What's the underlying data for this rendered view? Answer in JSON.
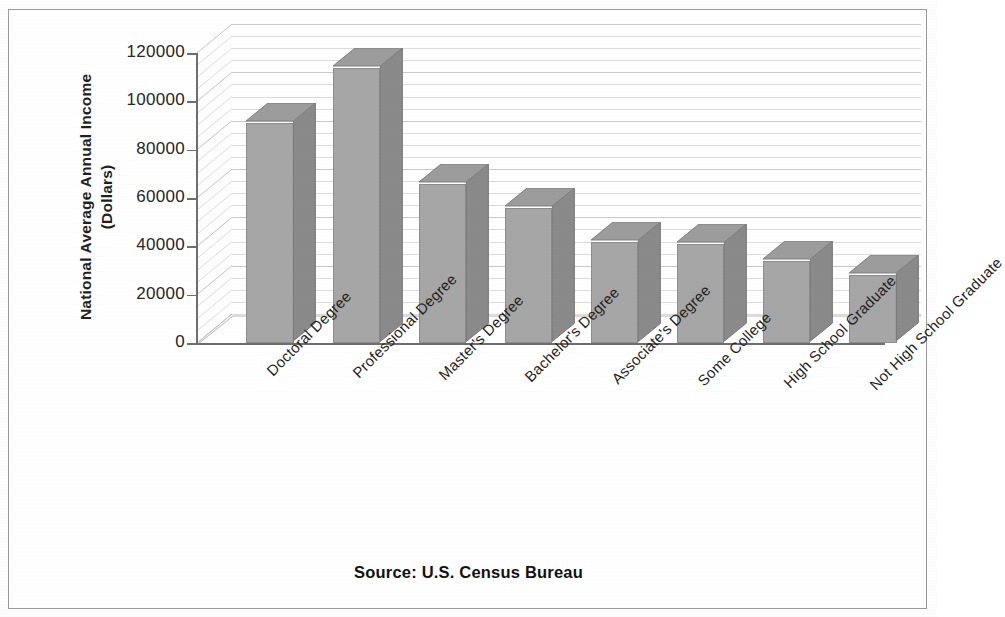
{
  "source_caption": "Source: U.S. Census Bureau",
  "axis": {
    "y_title_line1": "National Average Annual Income",
    "y_title_line2": "(Dollars)"
  },
  "chart_data": {
    "type": "bar",
    "title": "",
    "subtitle": "",
    "xlabel": "",
    "ylabel": "National Average Annual Income (Dollars)",
    "ylim": [
      0,
      120000
    ],
    "ytick_labels": [
      "0",
      "20000",
      "40000",
      "60000",
      "80000",
      "100000",
      "120000"
    ],
    "ytick_values": [
      0,
      20000,
      40000,
      60000,
      80000,
      100000,
      120000
    ],
    "grid": true,
    "grid_orientation": "horizontal",
    "legend": false,
    "three_d": true,
    "bar_color": "#a6a6a6",
    "bar_side_color": "#8a8a8a",
    "bar_top_color": "#9c9c9c",
    "categories": [
      "Doctoral Degree",
      "Professional Degree",
      "Master's Degree",
      "Bachelor's Degree",
      "Associate's Degree",
      "Some College",
      "High School Graduate",
      "Not High School Graduate"
    ],
    "values": [
      91000,
      114000,
      66000,
      56000,
      42000,
      41000,
      34000,
      28000
    ],
    "series": [
      {
        "name": "National Average Annual Income",
        "values": [
          91000,
          114000,
          66000,
          56000,
          42000,
          41000,
          34000,
          28000
        ]
      }
    ]
  }
}
